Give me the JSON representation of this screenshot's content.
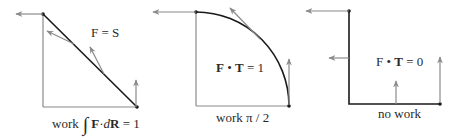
{
  "panels": [
    {
      "label": "F = S",
      "caption_prefix": "work",
      "caption_integral": "∫",
      "caption_F": "F",
      "caption_dot": "·",
      "caption_d": "d",
      "caption_R": "R",
      "caption_suffix": " = 1"
    },
    {
      "label_F": "F",
      "label_dot": " • ",
      "label_T": "T",
      "label_rest": " = 1",
      "caption": "work π / 2"
    },
    {
      "label_F": "F",
      "label_dot": " • ",
      "label_T": "T",
      "label_rest": " = 0",
      "caption": "no work"
    }
  ],
  "colors": {
    "path": "#1a1a1a",
    "axis": "#8a8a8a",
    "arrow": "#8a8a8a"
  }
}
